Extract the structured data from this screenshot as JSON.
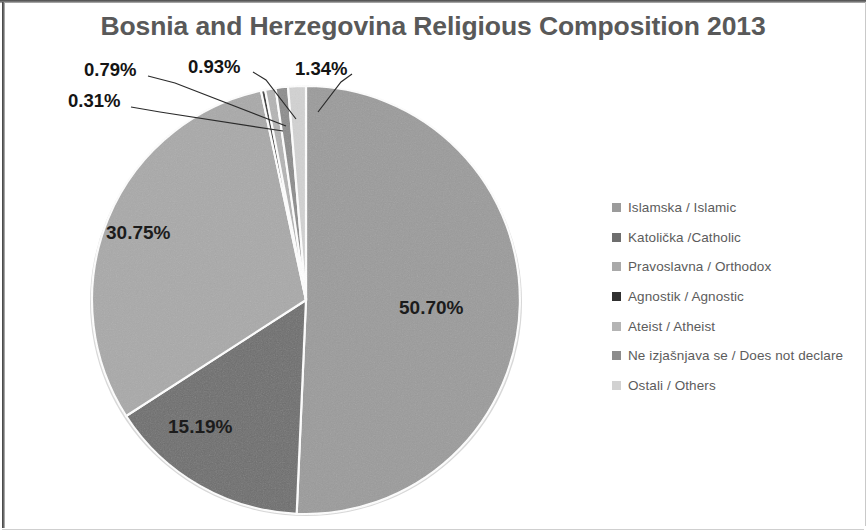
{
  "chart_data": {
    "type": "pie",
    "title": "Bosnia and Herzegovina Religious Composition 2013",
    "xlabel": "",
    "ylabel": "",
    "legend_position": "right",
    "grid": false,
    "start_angle_deg": 0,
    "direction": "clockwise",
    "categories": [
      "Islamska / Islamic",
      "Katolička /Catholic",
      "Pravoslavna / Orthodox",
      "Agnostik / Agnostic",
      "Ateist / Atheist",
      "Ne izjašnjava se / Does not declare",
      "Ostali / Others"
    ],
    "values": [
      50.7,
      15.19,
      30.75,
      0.31,
      0.79,
      0.93,
      1.34
    ],
    "value_labels": [
      "50.70%",
      "15.19%",
      "30.75%",
      "0.31%",
      "0.79%",
      "0.93%",
      "1.34%"
    ],
    "colors": [
      "#9b9b9b",
      "#6e6e6e",
      "#a9a9a9",
      "#303030",
      "#b4b4b4",
      "#8c8c8c",
      "#d2d2d2"
    ],
    "units": "percent"
  },
  "title": {
    "text": "Bosnia and Herzegovina Religious Composition 2013",
    "color": "#595959"
  },
  "pie": {
    "labels": {
      "islamic": "50.70%",
      "catholic": "15.19%",
      "orthodox": "30.75%",
      "agnostic": "0.31%",
      "atheist": "0.79%",
      "not_declare": "0.93%",
      "others": "1.34%"
    }
  },
  "legend": {
    "items": [
      {
        "label": "Islamska / Islamic",
        "color": "#9b9b9b"
      },
      {
        "label": "Katolička /Catholic",
        "color": "#6e6e6e"
      },
      {
        "label": "Pravoslavna / Orthodox",
        "color": "#a9a9a9"
      },
      {
        "label": "Agnostik / Agnostic",
        "color": "#303030"
      },
      {
        "label": "Ateist / Atheist",
        "color": "#b4b4b4"
      },
      {
        "label": "Ne izjašnjava se / Does not declare",
        "color": "#8c8c8c"
      },
      {
        "label": "Ostali / Others",
        "color": "#d2d2d2"
      }
    ]
  }
}
